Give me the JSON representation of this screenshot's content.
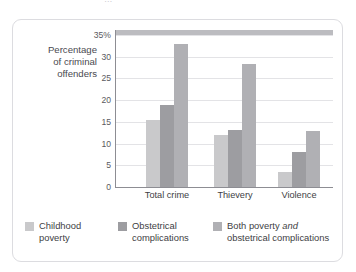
{
  "top_caption_partial": "…",
  "chart_data": {
    "type": "bar",
    "title": "",
    "xlabel": "",
    "ylabel": "Percentage of criminal offenders",
    "ylabel_lines": [
      "Percentage",
      "of criminal",
      "offenders"
    ],
    "categories": [
      "Total crime",
      "Thievery",
      "Violence"
    ],
    "yticks": [
      0,
      5,
      10,
      15,
      20,
      25,
      30,
      35
    ],
    "ytick_labels": [
      "0",
      "5",
      "10",
      "15",
      "20",
      "25",
      "30",
      "35%"
    ],
    "ylim": [
      0,
      35
    ],
    "grid": true,
    "legend_position": "bottom",
    "series": [
      {
        "name": "Childhood poverty",
        "color": "#c9c9cb",
        "values": [
          15.5,
          12.0,
          3.5
        ]
      },
      {
        "name": "Obstetrical complications",
        "color": "#9d9da1",
        "values": [
          19.0,
          13.2,
          8.0
        ]
      },
      {
        "name": "Both poverty and obstetrical complications",
        "color": "#b0b0b4",
        "values": [
          33.0,
          28.4,
          13.0
        ]
      }
    ]
  },
  "legend": {
    "items": [
      {
        "label_line1": "Childhood",
        "label_line2": "poverty",
        "color": "#c9c9cb"
      },
      {
        "label_line1": "Obstetrical",
        "label_line2": "complications",
        "color": "#9d9da1"
      },
      {
        "label_line1_pre": "Both poverty ",
        "label_line1_italic": "and",
        "label_line2": "obstetrical complications",
        "color": "#b0b0b4"
      }
    ]
  }
}
